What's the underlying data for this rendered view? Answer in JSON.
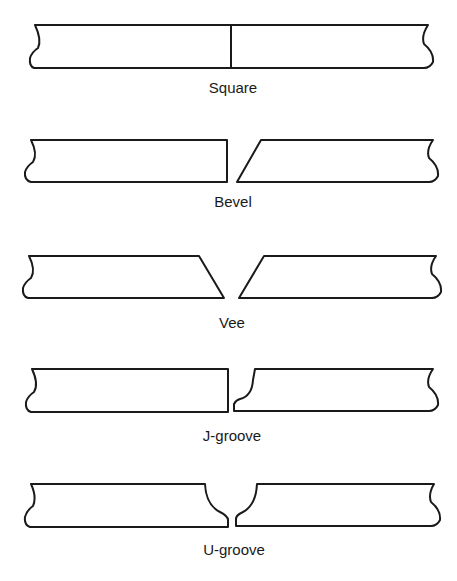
{
  "diagram": {
    "joints": [
      {
        "name": "square",
        "label": "Square",
        "description": "Two plates with square ends butted together, no gap"
      },
      {
        "name": "bevel",
        "label": "Bevel",
        "description": "Left plate square end, right plate single-bevel end, small root gap"
      },
      {
        "name": "vee",
        "label": "Vee",
        "description": "Both plates beveled forming a V, small root gap"
      },
      {
        "name": "j-groove",
        "label": "J-groove",
        "description": "Left plate square end, right plate J-shaped curved preparation with root face"
      },
      {
        "name": "u-groove",
        "label": "U-groove",
        "description": "Both plates curved forming a U with root faces"
      }
    ]
  }
}
